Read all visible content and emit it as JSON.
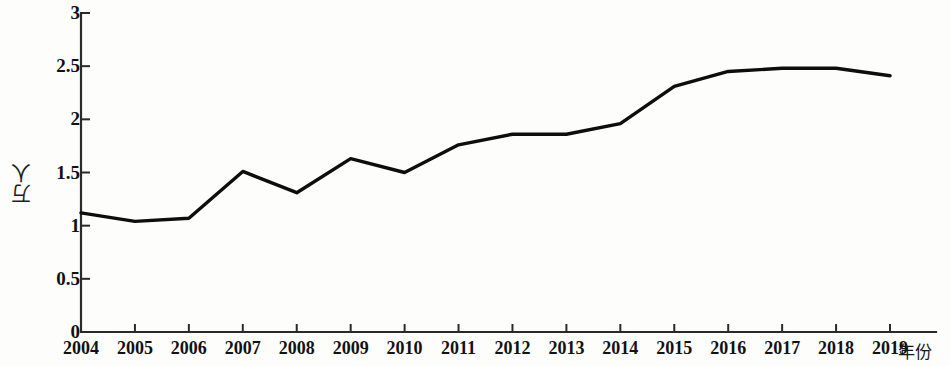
{
  "chart_data": {
    "type": "line",
    "title": "",
    "subtitle": "",
    "xlabel": "年份",
    "ylabel": "万人",
    "categories": [
      "2004",
      "2005",
      "2006",
      "2007",
      "2008",
      "2009",
      "2010",
      "2011",
      "2012",
      "2013",
      "2014",
      "2015",
      "2016",
      "2017",
      "2018",
      "2019"
    ],
    "x": [
      2004,
      2005,
      2006,
      2007,
      2008,
      2009,
      2010,
      2011,
      2012,
      2013,
      2014,
      2015,
      2016,
      2017,
      2018,
      2019
    ],
    "values": [
      1.12,
      1.04,
      1.07,
      1.51,
      1.31,
      1.63,
      1.5,
      1.76,
      1.86,
      1.86,
      1.96,
      2.31,
      2.45,
      2.48,
      2.48,
      2.41
    ],
    "series": [
      {
        "name": "",
        "values": [
          1.12,
          1.04,
          1.07,
          1.51,
          1.31,
          1.63,
          1.5,
          1.76,
          1.86,
          1.86,
          1.96,
          2.31,
          2.45,
          2.48,
          2.48,
          2.41
        ]
      }
    ],
    "ylim": [
      0,
      3
    ],
    "yticks": [
      0,
      0.5,
      1,
      1.5,
      2,
      2.5,
      3
    ],
    "ytick_labels": [
      "0",
      "0.5",
      "1",
      "1.5",
      "2",
      "2.5",
      "3"
    ],
    "xlim": [
      2004,
      2019
    ],
    "grid": false,
    "legend": false,
    "legend_position": "none",
    "line_color": "#0d0d0d",
    "background_color": "#fdfdfb",
    "axis_color": "#2a2a2a",
    "markers": false,
    "annotations": []
  },
  "axes": {
    "y_title": "万人",
    "x_title": "年份"
  }
}
